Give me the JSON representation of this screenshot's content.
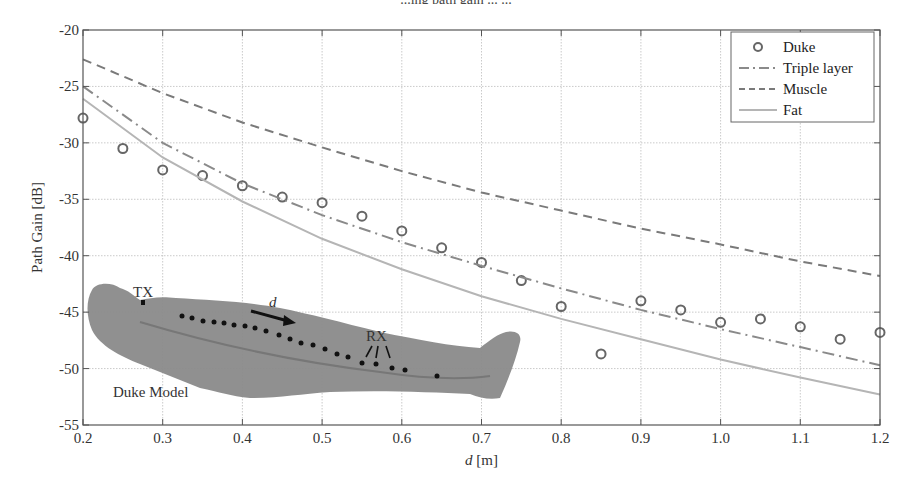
{
  "figure": {
    "caption_fragment": "...ing path gain ... ..."
  },
  "chart_data": {
    "type": "line",
    "title": "",
    "xlabel": "d [m]",
    "xlabel_italic": "d",
    "xlabel_unit": "[m]",
    "ylabel": "Path Gain [dB]",
    "xlim": [
      0.2,
      1.2
    ],
    "ylim": [
      -55,
      -20
    ],
    "grid": true,
    "legend_position": "upper right",
    "x_ticks": [
      0.2,
      0.3,
      0.4,
      0.5,
      0.6,
      0.7,
      0.8,
      0.9,
      1.0,
      1.1,
      1.2
    ],
    "x_tick_labels": [
      "0.2",
      "0.3",
      "0.4",
      "0.5",
      "0.6",
      "0.7",
      "0.8",
      "0.9",
      "1.0",
      "1.1",
      "1.2"
    ],
    "y_ticks": [
      -20,
      -25,
      -30,
      -35,
      -40,
      -45,
      -50,
      -55
    ],
    "y_tick_labels": [
      "-20",
      "-25",
      "-30",
      "-35",
      "-40",
      "-45",
      "-50",
      "-55"
    ],
    "series": [
      {
        "name": "Duke",
        "style": "markers-circle",
        "color": "#666666",
        "x": [
          0.2,
          0.25,
          0.3,
          0.35,
          0.4,
          0.45,
          0.5,
          0.55,
          0.6,
          0.65,
          0.7,
          0.75,
          0.8,
          0.85,
          0.9,
          0.95,
          1.0,
          1.05,
          1.1,
          1.15,
          1.2
        ],
        "values": [
          -27.8,
          -30.5,
          -32.4,
          -32.9,
          -33.8,
          -34.8,
          -35.3,
          -36.5,
          -37.8,
          -39.3,
          -40.6,
          -42.2,
          -44.5,
          -48.7,
          -44.0,
          -44.8,
          -45.9,
          -45.6,
          -46.3,
          -47.4,
          -46.8
        ]
      },
      {
        "name": "Triple layer",
        "style": "dash-dot",
        "color": "#8a8a8a",
        "x": [
          0.2,
          0.3,
          0.4,
          0.5,
          0.6,
          0.7,
          0.8,
          0.9,
          1.0,
          1.1,
          1.2
        ],
        "values": [
          -25.0,
          -30.0,
          -33.6,
          -36.4,
          -38.8,
          -40.9,
          -42.9,
          -44.8,
          -46.5,
          -48.1,
          -49.7
        ]
      },
      {
        "name": "Muscle",
        "style": "dashed",
        "color": "#7a7a7a",
        "x": [
          0.2,
          0.3,
          0.4,
          0.5,
          0.6,
          0.7,
          0.8,
          0.9,
          1.0,
          1.1,
          1.2
        ],
        "values": [
          -22.6,
          -25.6,
          -28.2,
          -30.4,
          -32.5,
          -34.4,
          -36.0,
          -37.6,
          -39.0,
          -40.5,
          -41.8
        ]
      },
      {
        "name": "Fat",
        "style": "solid",
        "color": "#b5b5b5",
        "x": [
          0.2,
          0.3,
          0.4,
          0.5,
          0.6,
          0.7,
          0.8,
          0.9,
          1.0,
          1.1,
          1.2
        ],
        "values": [
          -26.1,
          -31.3,
          -35.2,
          -38.5,
          -41.2,
          -43.6,
          -45.6,
          -47.4,
          -49.2,
          -50.8,
          -52.3
        ]
      }
    ],
    "annotations": [
      {
        "text": "TX",
        "note": "transmitter marker on Duke model"
      },
      {
        "text": "d",
        "note": "arrow indicating distance direction"
      },
      {
        "text": "RX",
        "note": "receiver positions with arrows"
      },
      {
        "text": "Duke Model",
        "note": "human body phantom image inset"
      }
    ]
  },
  "legend": {
    "items": [
      {
        "label": "Duke"
      },
      {
        "label": "Triple layer"
      },
      {
        "label": "Muscle"
      },
      {
        "label": "Fat"
      }
    ]
  },
  "inset": {
    "tx_label": "TX",
    "rx_label": "RX",
    "d_label": "d",
    "model_label": "Duke Model"
  }
}
